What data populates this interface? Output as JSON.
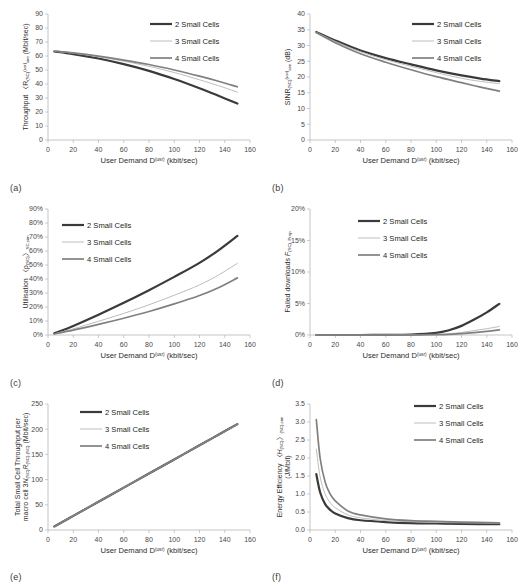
{
  "figure": {
    "panels": [
      "(a)",
      "(b)",
      "(c)",
      "(d)",
      "(e)",
      "(f)"
    ],
    "series_colors": {
      "2 Small Cells": "#3a3a3a",
      "3 Small Cells": "#bdbdbd",
      "4 Small Cells": "#808080"
    },
    "series_widths": {
      "2 Small Cells": 2.2,
      "3 Small Cells": 1.0,
      "4 Small Cells": 1.7
    },
    "legend_labels": [
      "2 Small Cells",
      "3 Small Cells",
      "4 Small Cells"
    ],
    "xlabel_html": "User Demand D<sup>(usr)</sup> (kbit/sec)"
  },
  "chart_data": [
    {
      "type": "line",
      "panel": "(a)",
      "title": "",
      "ylabel": "Throughput ⟨R_{SC}^{(usr)}⟩_{sim} (Mbit/sec)",
      "ylabel_html": "Throughput 〈R<sub>(SC)</sub><sup>(usr)</sup><sub>sim</sub> (Mbit/sec)",
      "xlabel": "User Demand D^(usr) (kbit/sec)",
      "xlim": [
        0,
        160
      ],
      "ylim": [
        0,
        90
      ],
      "xticks": [
        0,
        20,
        40,
        60,
        80,
        100,
        120,
        140,
        160
      ],
      "yticks": [
        0,
        10,
        20,
        30,
        40,
        50,
        60,
        70,
        80,
        90
      ],
      "ytick_labels": [
        "0",
        "10",
        "20",
        "30",
        "40",
        "50",
        "60",
        "70",
        "80",
        "90"
      ],
      "grid": false,
      "legend_position": "top-right",
      "x": [
        5,
        20,
        40,
        60,
        80,
        100,
        120,
        135,
        150
      ],
      "series": [
        {
          "name": "2 Small Cells",
          "values": [
            63.2,
            61.4,
            58.2,
            54.2,
            49.4,
            43.6,
            37.0,
            31.6,
            26.0
          ]
        },
        {
          "name": "3 Small Cells",
          "values": [
            63.4,
            62.0,
            59.4,
            56.3,
            52.6,
            48.2,
            43.0,
            38.8,
            34.2
          ]
        },
        {
          "name": "4 Small Cells",
          "values": [
            63.5,
            62.2,
            59.9,
            57.1,
            53.9,
            50.0,
            45.6,
            42.0,
            38.0
          ]
        }
      ]
    },
    {
      "type": "line",
      "panel": "(b)",
      "title": "",
      "ylabel": "SINR_{SC}^{(usr)}_{sim} (dB)",
      "ylabel_html": "SINR<sub>(SC)</sub><sup>(usr)</sup><sub>sim</sub> (dB)",
      "xlabel": "User Demand D^(usr) (kbit/sec)",
      "xlim": [
        0,
        160
      ],
      "ylim": [
        0,
        40
      ],
      "xticks": [
        0,
        20,
        40,
        60,
        80,
        100,
        120,
        140,
        160
      ],
      "yticks": [
        0,
        5,
        10,
        15,
        20,
        25,
        30,
        35,
        40
      ],
      "ytick_labels": [
        "0",
        "5",
        "10",
        "15",
        "20",
        "25",
        "30",
        "35",
        "40"
      ],
      "grid": false,
      "legend_position": "top-right",
      "x": [
        5,
        20,
        40,
        60,
        80,
        100,
        120,
        135,
        150
      ],
      "series": [
        {
          "name": "2 Small Cells",
          "values": [
            34.3,
            31.6,
            28.4,
            26.0,
            24.0,
            22.1,
            20.5,
            19.5,
            18.7
          ]
        },
        {
          "name": "3 Small Cells",
          "values": [
            34.2,
            31.3,
            28.0,
            25.5,
            23.4,
            21.4,
            19.6,
            18.6,
            17.9
          ]
        },
        {
          "name": "4 Small Cells",
          "values": [
            34.1,
            30.9,
            27.4,
            24.7,
            22.3,
            20.1,
            18.2,
            16.8,
            15.5
          ]
        }
      ]
    },
    {
      "type": "line",
      "panel": "(c)",
      "title": "",
      "ylabel": "Utilisation ⟨ρ_{SC}⟩_{SC,sim}",
      "ylabel_html": "Utilisation 〈ρ<sub>(SC)</sub>〉<sub>SC,sim</sub>",
      "xlabel": "User Demand D^(usr) (kbit/sec)",
      "xlim": [
        0,
        160
      ],
      "ylim": [
        0,
        90
      ],
      "xticks": [
        0,
        20,
        40,
        60,
        80,
        100,
        120,
        140,
        160
      ],
      "yticks": [
        0,
        10,
        20,
        30,
        40,
        50,
        60,
        70,
        80,
        90
      ],
      "ytick_labels": [
        "0%",
        "10%",
        "20%",
        "30%",
        "40%",
        "50%",
        "60%",
        "70%",
        "80%",
        "90%"
      ],
      "grid": false,
      "legend_position": "top-left",
      "x": [
        5,
        20,
        40,
        60,
        80,
        100,
        120,
        135,
        150
      ],
      "series": [
        {
          "name": "2 Small Cells",
          "values": [
            1.2,
            6.5,
            14.5,
            23.0,
            32.0,
            41.5,
            51.5,
            60.5,
            70.8
          ]
        },
        {
          "name": "3 Small Cells",
          "values": [
            0.9,
            4.4,
            9.8,
            15.4,
            21.6,
            28.4,
            35.8,
            42.8,
            51.2
          ]
        },
        {
          "name": "4 Small Cells",
          "values": [
            0.8,
            3.5,
            7.6,
            12.0,
            16.8,
            22.2,
            28.2,
            33.8,
            40.8
          ]
        }
      ]
    },
    {
      "type": "line",
      "panel": "(d)",
      "title": "",
      "ylabel": "Failed downloads F_{SC,Prop}",
      "ylabel_html": "Failed downloads <i>F</i><sub>(SC), Prop</sub>",
      "xlabel": "User Demand D^(usr) (kbit/sec)",
      "xlim": [
        0,
        160
      ],
      "ylim": [
        0,
        20
      ],
      "xticks": [
        0,
        20,
        40,
        60,
        80,
        100,
        120,
        140,
        160
      ],
      "yticks": [
        0,
        5,
        10,
        15,
        20
      ],
      "ytick_labels": [
        "0%",
        "5%",
        "10%",
        "15%",
        "20%"
      ],
      "grid": false,
      "legend_position": "top-center",
      "x": [
        5,
        20,
        40,
        60,
        80,
        100,
        110,
        120,
        130,
        140,
        150
      ],
      "series": [
        {
          "name": "2 Small Cells",
          "values": [
            0.0,
            0.0,
            0.0,
            0.02,
            0.08,
            0.35,
            0.75,
            1.45,
            2.45,
            3.6,
            4.95
          ]
        },
        {
          "name": "3 Small Cells",
          "values": [
            0.0,
            0.0,
            0.0,
            0.0,
            0.02,
            0.1,
            0.2,
            0.4,
            0.7,
            1.0,
            1.35
          ]
        },
        {
          "name": "4 Small Cells",
          "values": [
            0.0,
            0.0,
            0.0,
            0.0,
            0.0,
            0.05,
            0.1,
            0.22,
            0.38,
            0.58,
            0.8
          ]
        }
      ]
    },
    {
      "type": "line",
      "panel": "(e)",
      "title": "",
      "ylabel": "Total Small Cell Throughput per macro cell 3N_{SC}R_{SC,SC} (Mbit/sec)",
      "ylabel_html": "Total Small Cell Throughput per<br>macro cell 3<i>N</i><sub>(SC)</sub><i>R</i><sub>(SC),(SC)</sub> (Mbit/sec)",
      "xlabel": "User Demand D^(usr) (kbit/sec)",
      "xlim": [
        0,
        160
      ],
      "ylim": [
        0,
        250
      ],
      "xticks": [
        0,
        20,
        40,
        60,
        80,
        100,
        120,
        140,
        160
      ],
      "yticks": [
        0,
        50,
        100,
        150,
        200,
        250
      ],
      "ytick_labels": [
        "0",
        "50",
        "100",
        "150",
        "200",
        "250"
      ],
      "grid": false,
      "legend_position": "top-center",
      "x": [
        5,
        20,
        40,
        60,
        80,
        100,
        120,
        135,
        150
      ],
      "series": [
        {
          "name": "2 Small Cells",
          "values": [
            7,
            28,
            56,
            84,
            112,
            140,
            168,
            189,
            210
          ]
        },
        {
          "name": "3 Small Cells",
          "values": [
            7,
            28,
            56,
            84,
            112,
            140,
            168,
            189,
            210
          ]
        },
        {
          "name": "4 Small Cells",
          "values": [
            7,
            28,
            56,
            84,
            112,
            140,
            168,
            189,
            210
          ]
        }
      ]
    },
    {
      "type": "line",
      "panel": "(f)",
      "title": "",
      "ylabel": "Energy Efficiency ⟨H_{SC}⟩_{SC,sim} (J/Mbit)",
      "ylabel_html": "Energy Efficiency 〈<i>H</i><sub>(SC)</sub>〉<sub>(SC),sim</sub><br>(J/Mbit)",
      "xlabel": "User Demand D^(usr) (kbit/sec)",
      "xlim": [
        0,
        160
      ],
      "ylim": [
        0,
        3.5
      ],
      "xticks": [
        0,
        20,
        40,
        60,
        80,
        100,
        120,
        140,
        160
      ],
      "yticks": [
        0,
        0.5,
        1.0,
        1.5,
        2.0,
        2.5,
        3.0,
        3.5
      ],
      "ytick_labels": [
        "0.0",
        "0.5",
        "1.0",
        "1.5",
        "2.0",
        "2.5",
        "3.0",
        "3.5"
      ],
      "grid": false,
      "legend_position": "top-right",
      "x": [
        5,
        8,
        12,
        16,
        20,
        30,
        40,
        60,
        80,
        100,
        120,
        150
      ],
      "series": [
        {
          "name": "2 Small Cells",
          "values": [
            1.55,
            1.05,
            0.72,
            0.56,
            0.46,
            0.33,
            0.27,
            0.22,
            0.19,
            0.18,
            0.17,
            0.16
          ]
        },
        {
          "name": "3 Small Cells",
          "values": [
            2.25,
            1.48,
            1.0,
            0.76,
            0.62,
            0.42,
            0.34,
            0.26,
            0.23,
            0.21,
            0.2,
            0.19
          ]
        },
        {
          "name": "4 Small Cells",
          "values": [
            3.07,
            2.0,
            1.33,
            1.0,
            0.81,
            0.53,
            0.42,
            0.31,
            0.26,
            0.24,
            0.22,
            0.2
          ]
        }
      ]
    }
  ]
}
